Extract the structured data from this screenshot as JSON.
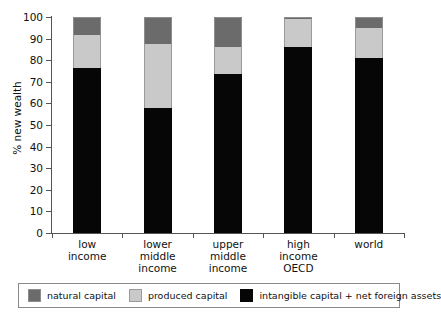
{
  "chart_data": {
    "type": "bar",
    "subtype": "stacked-bar",
    "title": "",
    "xlabel": "",
    "ylabel": "% new wealth",
    "ylim": [
      0,
      100
    ],
    "yticks": [
      0,
      10,
      20,
      30,
      40,
      50,
      60,
      70,
      80,
      90,
      100
    ],
    "grid": false,
    "legend_position": "bottom",
    "categories": [
      "low income",
      "lower middle income",
      "upper middle income",
      "high income OECD",
      "world"
    ],
    "category_label_lines": [
      [
        "low",
        "income"
      ],
      [
        "lower",
        "middle",
        "income"
      ],
      [
        "upper",
        "middle",
        "income"
      ],
      [
        "high",
        "income",
        "OECD"
      ],
      [
        "world"
      ]
    ],
    "series": [
      {
        "name": "intangible capital + net foreign assets",
        "color": "#060606",
        "values": [
          76.5,
          58.0,
          73.5,
          86.0,
          81.0
        ]
      },
      {
        "name": "produced capital",
        "color": "#c9c9c9",
        "values": [
          15.0,
          29.5,
          12.5,
          13.0,
          14.0
        ]
      },
      {
        "name": "natural capital",
        "color": "#6b6b6b",
        "values": [
          8.5,
          12.5,
          14.0,
          1.0,
          5.0
        ]
      }
    ],
    "stack_order_bottom_to_top": [
      "intangible capital + net foreign assets",
      "produced capital",
      "natural capital"
    ]
  },
  "legend": {
    "items": [
      {
        "label": "natural capital",
        "color": "#6b6b6b"
      },
      {
        "label": "produced capital",
        "color": "#c9c9c9"
      },
      {
        "label": "intangible capital + net foreign assets",
        "color": "#060606"
      }
    ]
  },
  "axis": {
    "y_title": "% new wealth",
    "y_tick_labels": [
      "0",
      "10",
      "20",
      "30",
      "40",
      "50",
      "60",
      "70",
      "80",
      "90",
      "100"
    ]
  }
}
